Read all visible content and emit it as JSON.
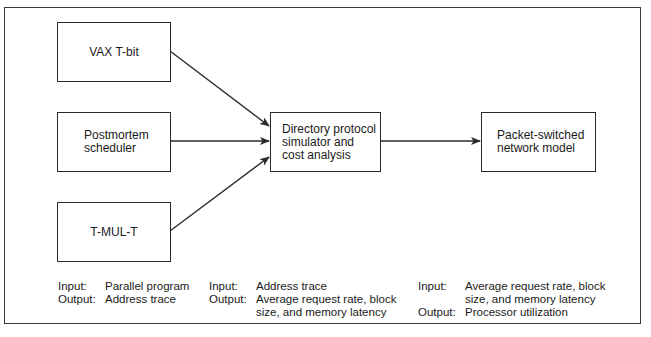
{
  "diagram": {
    "nodes": [
      {
        "id": "vax",
        "label": "VAX T-bit"
      },
      {
        "id": "postmortem",
        "label": "Postmortem\nscheduler"
      },
      {
        "id": "tmult",
        "label": "T-MUL-T"
      },
      {
        "id": "directory",
        "label": "Directory protocol\nsimulator and\ncost analysis"
      },
      {
        "id": "packet",
        "label": "Packet-switched\nnetwork model"
      }
    ],
    "edges": [
      {
        "from": "vax",
        "to": "directory"
      },
      {
        "from": "postmortem",
        "to": "directory"
      },
      {
        "from": "tmult",
        "to": "directory"
      },
      {
        "from": "directory",
        "to": "packet"
      }
    ],
    "io_blocks": [
      {
        "input_key": "Input:",
        "input_value": "Parallel program",
        "output_key": "Output:",
        "output_value": "Address trace"
      },
      {
        "input_key": "Input:",
        "input_value": "Address trace",
        "output_key": "Output:",
        "output_value": "Average request rate, block\nsize, and memory latency"
      },
      {
        "input_key": "Input:",
        "input_value": "Average request rate, block\nsize, and memory latency",
        "output_key": "Output:",
        "output_value": "Processor utilization"
      }
    ],
    "colors": {
      "line": "#2a2a2a",
      "background": "#ffffff",
      "text": "#1a1a1a"
    }
  }
}
